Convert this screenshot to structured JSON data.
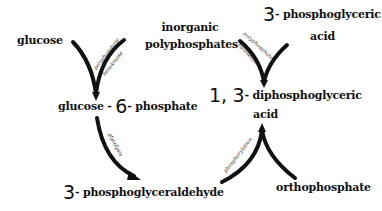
{
  "diagram": {
    "type": "biochemical pathway",
    "nodes": {
      "glucose": "glucose",
      "inorganic_polyphosphates": [
        "inorganic",
        "polyphosphates"
      ],
      "three_pga": {
        "prefix": "3",
        "rest": "- phosphoglyceric",
        "line2": "acid"
      },
      "g6p": {
        "part1": "glucose -",
        "six": "6",
        "part2": "- phosphate"
      },
      "dpga": {
        "prefix": "1, 3",
        "rest": "- diphosphoglyceric",
        "line2": "acid"
      },
      "g3p": {
        "prefix": "3",
        "rest": "- phosphoglyceraldehyde"
      },
      "orthophosphate": "orthophosphate"
    },
    "enzymes": {
      "left_v_top": "polyphosphate",
      "left_v_bottom": "hexokinase",
      "right_v_top": "polyphosphate",
      "right_v_bottom": "synthetase",
      "glycolysis": "glycolysis",
      "phosphorylation": "phosphorylation"
    },
    "edges": [
      {
        "from": [
          "glucose",
          "inorganic polyphosphates"
        ],
        "to": "glucose-6-phosphate",
        "label": "polyphosphate hexokinase"
      },
      {
        "from": [
          "3-phosphoglyceric acid"
        ],
        "to": "1,3-diphosphoglyceric acid",
        "label": "polyphosphate synthetase",
        "note": "converging arms"
      },
      {
        "from": "glucose-6-phosphate",
        "to": "3-phosphoglyceraldehyde",
        "label": "glycolysis"
      },
      {
        "from": [
          "3-phosphoglyceraldehyde",
          "orthophosphate"
        ],
        "to": "1,3-diphosphoglyceric acid",
        "label": "phosphorylation"
      }
    ],
    "colors": {
      "ink": "#111111",
      "background": "#ffffff"
    }
  }
}
